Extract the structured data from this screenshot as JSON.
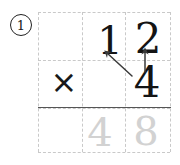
{
  "problem": {
    "number_label": "1",
    "operation": "multiplication"
  },
  "operator": {
    "symbol": "×"
  },
  "operands": {
    "multiplicand_tens": "1",
    "multiplicand_ones": "2",
    "multiplier": "4"
  },
  "answer": {
    "tens": "4",
    "ones": "8",
    "style": "faint-guide"
  },
  "arrows": [
    {
      "name": "ones-to-ones",
      "from": "multiplier-4",
      "to": "digit-2",
      "direction": "up"
    },
    {
      "name": "ones-to-tens",
      "from": "multiplier-4",
      "to": "digit-1",
      "direction": "up-left"
    }
  ],
  "grid": {
    "columns": 3,
    "rows": 3,
    "line_style": "dashed",
    "line_color": "#c9c9c9"
  },
  "colors": {
    "ink": "#141414",
    "faint_ink": "#d2d2d2",
    "grid": "#c9c9c9",
    "rule": "#555555",
    "background": "#ffffff"
  }
}
